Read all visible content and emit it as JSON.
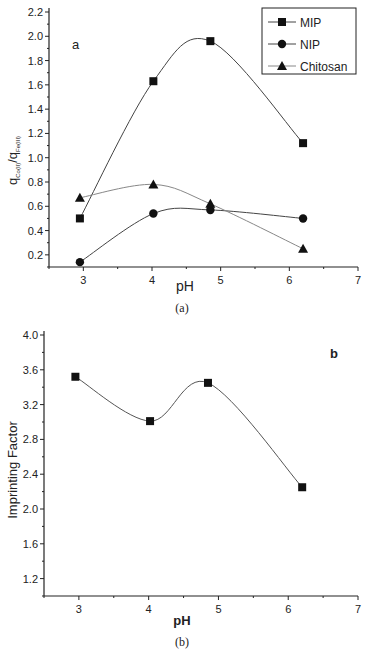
{
  "chart_data": [
    {
      "type": "line",
      "title": "",
      "panel_label": "a",
      "caption": "(a)",
      "xlabel": "pH",
      "ylabel": "q_Co(II)/q_Fe(III)",
      "ylabel_main": "q",
      "ylabel_sub1": "Co(II)",
      "ylabel_sub2": "Fe(III)",
      "xlim": [
        2.5,
        7
      ],
      "ylim": [
        0.1,
        2.2
      ],
      "xticks": [
        3,
        4,
        5,
        6,
        7
      ],
      "yticks": [
        0.2,
        0.4,
        0.6,
        0.8,
        1.0,
        1.2,
        1.4,
        1.6,
        1.8,
        2.0,
        2.2
      ],
      "grid": false,
      "legend_position": "upper right",
      "x": [
        2.95,
        4.02,
        4.85,
        6.2
      ],
      "series": [
        {
          "name": "MIP",
          "marker": "square",
          "values": [
            0.5,
            1.63,
            1.96,
            1.12
          ]
        },
        {
          "name": "NIP",
          "marker": "circle",
          "values": [
            0.14,
            0.54,
            0.57,
            0.5
          ]
        },
        {
          "name": "Chitosan",
          "marker": "triangle",
          "values": [
            0.67,
            0.78,
            0.62,
            0.25
          ]
        }
      ]
    },
    {
      "type": "line",
      "title": "",
      "panel_label": "b",
      "caption": "(b)",
      "xlabel": "pH",
      "ylabel": "Imprinting Factor",
      "xlim": [
        2.5,
        7
      ],
      "ylim": [
        1.0,
        4.0
      ],
      "xticks": [
        3,
        4,
        5,
        6,
        7
      ],
      "yticks": [
        1.2,
        1.6,
        2.0,
        2.4,
        2.8,
        3.2,
        3.6,
        4.0
      ],
      "grid": false,
      "x": [
        2.95,
        4.02,
        4.85,
        6.2
      ],
      "series": [
        {
          "name": "Imprinting Factor",
          "marker": "square",
          "values": [
            3.52,
            3.01,
            3.45,
            2.25
          ]
        }
      ]
    }
  ]
}
